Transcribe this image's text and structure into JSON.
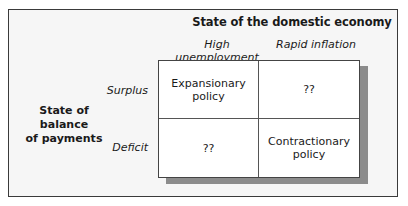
{
  "diagram": {
    "column_axis_title": "State of the domestic economy",
    "column_headers": [
      "High unemployment",
      "Rapid inflation"
    ],
    "row_axis_title_line1": "State of balance",
    "row_axis_title_line2": "of payments",
    "row_headers": [
      "Surplus",
      "Deficit"
    ],
    "cells": {
      "surplus_high_unemployment_line1": "Expansionary",
      "surplus_high_unemployment_line2": "policy",
      "surplus_rapid_inflation": "??",
      "deficit_high_unemployment": "??",
      "deficit_rapid_inflation_line1": "Contractionary",
      "deficit_rapid_inflation_line2": "policy"
    }
  }
}
